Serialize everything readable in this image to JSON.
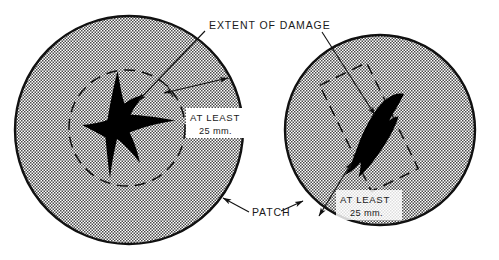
{
  "figure": {
    "background_color": "#ffffff",
    "ink_color": "#1a1a1a",
    "damage_fill_color": "#000000",
    "patch_fill": "stipple-screen-gray",
    "width": 499,
    "height": 260
  },
  "labels": {
    "extent_of_damage": "EXTENT OF DAMAGE",
    "patch": "PATCH",
    "at_least_line1": "AT LEAST",
    "at_least_line2": "25 mm."
  },
  "callouts": [
    {
      "name": "extent-of-damage",
      "text": "EXTENT OF DAMAGE",
      "points_to": [
        "left-damage-shape",
        "right-damage-shape"
      ]
    },
    {
      "name": "patch",
      "text": "PATCH",
      "points_to": [
        "left-patch-circle",
        "right-patch-circle"
      ]
    },
    {
      "name": "left-clearance-dimension",
      "text": "AT LEAST 25 mm.",
      "value": 25,
      "unit": "mm",
      "qualifier": "AT LEAST",
      "measures": "radial gap between damage outline and patch edge"
    },
    {
      "name": "right-clearance-dimension",
      "text": "AT LEAST 25 mm.",
      "value": 25,
      "unit": "mm",
      "qualifier": "AT LEAST",
      "measures": "gap between damage outline and patch edge"
    }
  ],
  "views": [
    {
      "name": "left-view",
      "patch_shape": "circle",
      "damage_outline_shape": "dashed-circle",
      "damage_silhouette": "irregular star / three-pointed tear"
    },
    {
      "name": "right-view",
      "patch_shape": "circle",
      "damage_outline_shape": "dashed-rectangle-rotated",
      "damage_silhouette": "elongated leaf-shaped tear"
    }
  ]
}
